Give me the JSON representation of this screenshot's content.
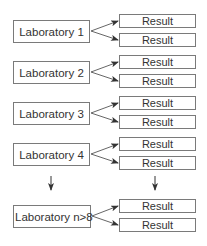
{
  "diagram": {
    "labs": [
      {
        "label": "Laboratory 1",
        "results": [
          "Result",
          "Result"
        ]
      },
      {
        "label": "Laboratory 2",
        "results": [
          "Result",
          "Result"
        ]
      },
      {
        "label": "Laboratory 3",
        "results": [
          "Result",
          "Result"
        ]
      },
      {
        "label": "Laboratory 4",
        "results": [
          "Result",
          "Result"
        ]
      },
      {
        "label": "Laboratory n>8",
        "results": [
          "Result",
          "Result"
        ]
      }
    ],
    "continuation_arrows": [
      "down-arrow-labs",
      "down-arrow-results"
    ],
    "colors": {
      "border": "#7a7a7a",
      "arrow": "#333333",
      "text": "#333333"
    }
  }
}
